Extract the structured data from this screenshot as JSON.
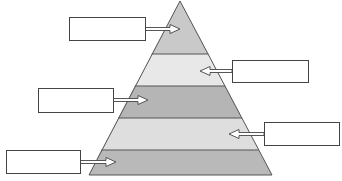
{
  "diagram": {
    "type": "pyramid",
    "title": "",
    "levels": [
      {
        "index": 1,
        "position": "top",
        "fill": "#c9c9c9",
        "label": "",
        "callout_side": "left"
      },
      {
        "index": 2,
        "position": "upper-middle",
        "fill": "#e8e8e8",
        "label": "",
        "callout_side": "right"
      },
      {
        "index": 3,
        "position": "middle",
        "fill": "#b5b5b5",
        "label": "",
        "callout_side": "left"
      },
      {
        "index": 4,
        "position": "lower-middle",
        "fill": "#dedede",
        "label": "",
        "callout_side": "right"
      },
      {
        "index": 5,
        "position": "bottom",
        "fill": "#b9b9b9",
        "label": "",
        "callout_side": "left"
      }
    ],
    "stroke_color": "#555555",
    "arrow_fill": "#ffffff"
  }
}
